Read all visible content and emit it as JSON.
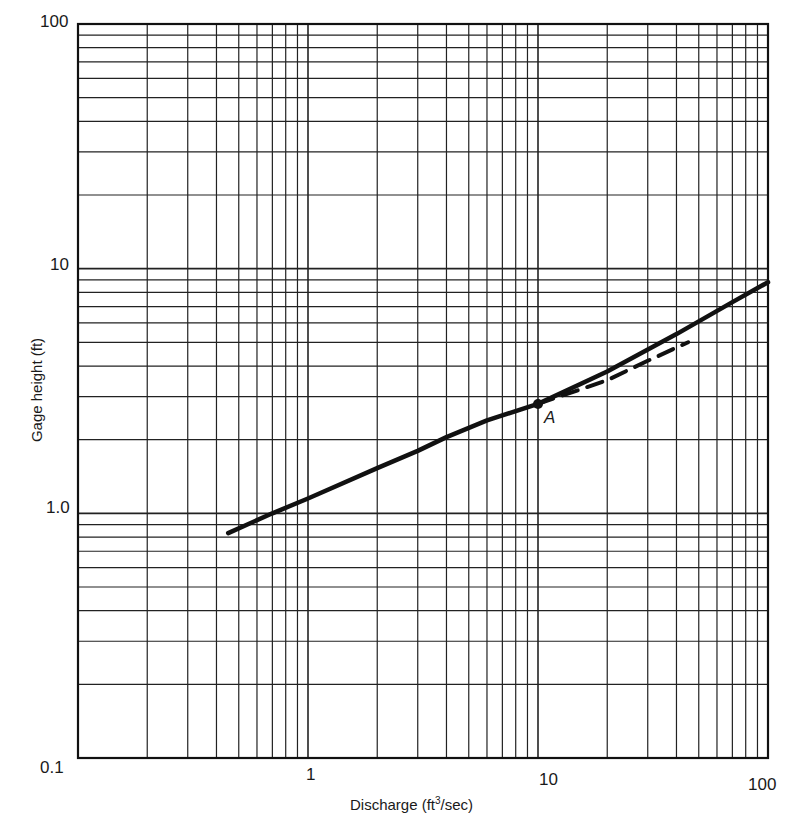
{
  "chart_data": {
    "type": "line",
    "title": "",
    "xlabel": "Discharge (ft³/sec)",
    "xlabel_parts": {
      "pre": "Discharge (ft",
      "sup": "3",
      "post": "/sec)"
    },
    "ylabel": "Gage height (ft)",
    "xscale": "log",
    "yscale": "log",
    "xlim": [
      0.1,
      100
    ],
    "ylim": [
      0.1,
      100
    ],
    "grid": true,
    "legend": null,
    "x_tick_labels": [
      "0.1",
      "1",
      "10",
      "100"
    ],
    "y_tick_labels": [
      "0.1",
      "1.0",
      "10",
      "100"
    ],
    "series": [
      {
        "name": "Rating curve (solid)",
        "style": "solid",
        "x": [
          0.45,
          0.7,
          1,
          2,
          3,
          4,
          6,
          10,
          20,
          40,
          70,
          100
        ],
        "y": [
          0.83,
          1.0,
          1.15,
          1.53,
          1.8,
          2.05,
          2.4,
          2.8,
          3.8,
          5.4,
          7.3,
          8.8
        ]
      },
      {
        "name": "Extension (dashed)",
        "style": "dashed",
        "x": [
          10,
          20,
          30,
          45
        ],
        "y": [
          2.8,
          3.5,
          4.2,
          5.0
        ]
      }
    ],
    "annotations": [
      {
        "label": "A",
        "x": 10,
        "y": 2.8,
        "marker": "point"
      }
    ]
  },
  "labels": {
    "x_ticks": {
      "t0": "0.1",
      "t1": "1",
      "t2": "10",
      "t3": "100"
    },
    "y_ticks": {
      "t0": "0.1",
      "t1": "1.0",
      "t2": "10",
      "t3": "100"
    },
    "xlabel_pre": "Discharge (ft",
    "xlabel_sup": "3",
    "xlabel_post": "/sec)",
    "ylabel": "Gage height (ft)",
    "point_label": "A"
  },
  "style": {
    "line_color": "#111111",
    "grid_color": "#222222",
    "background": "#ffffff"
  }
}
